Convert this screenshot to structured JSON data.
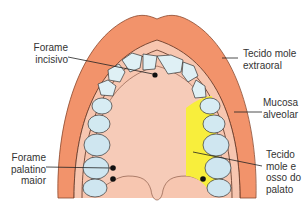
{
  "diagram": {
    "type": "anatomical",
    "colors": {
      "extraoral_tissue": "#f2936b",
      "extraoral_outline": "#8a4a30",
      "alveolar_mucosa": "#f7c6b0",
      "palate": "#f6cbb8",
      "teeth_fill": "#dff0f5",
      "molar_fill": "#cfe6f0",
      "palate_soft_bone_highlight": "#f8ee3c",
      "foramen": "#111111",
      "leader_line": "#222222"
    }
  },
  "labels": {
    "forame_incisivo": [
      "Forame",
      "incisivo"
    ],
    "tecido_mole_extraoral": [
      "Tecido mole",
      "extraoral"
    ],
    "mucosa_alveolar": [
      "Mucosa",
      "alveolar"
    ],
    "forame_palatino_maior": [
      "Forame",
      "palatino",
      "maior"
    ],
    "tecido_mole_osso_palato": [
      "Tecido",
      "mole e",
      "osso do",
      "palato"
    ]
  }
}
